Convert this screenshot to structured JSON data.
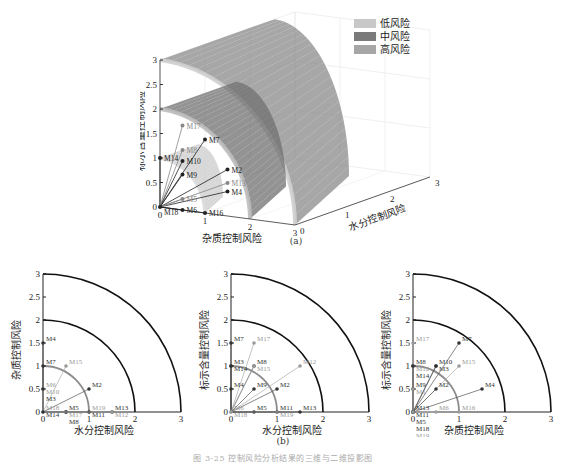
{
  "figure": {
    "caption_a": "(a)",
    "caption_b": "(b)",
    "title": "图 3-25  控制风险分析结果的三维与二维投影图"
  },
  "legend": {
    "items": [
      {
        "label": "低风险",
        "color": "#c8c8c8"
      },
      {
        "label": "中风险",
        "color": "#7a7a7a"
      },
      {
        "label": "高风险",
        "color": "#a6a6a6"
      }
    ]
  },
  "chart_data": [
    {
      "id": "a",
      "type": "scatter",
      "title": "(a)",
      "dimensions": 3,
      "axes": {
        "x": {
          "label": "杂质控制风险",
          "ticks": [
            0,
            1,
            2,
            3
          ],
          "range": [
            0,
            3
          ]
        },
        "y": {
          "label": "水分控制风险",
          "ticks": [
            0,
            1,
            2,
            3
          ],
          "range": [
            0,
            3
          ]
        },
        "z": {
          "label": "标示含量控制风险",
          "ticks": [
            0,
            0.5,
            1,
            1.5,
            2,
            2.5,
            3
          ],
          "range": [
            0,
            3
          ]
        }
      },
      "surfaces": [
        {
          "name": "低风险",
          "radius": 1
        },
        {
          "name": "中风险",
          "radius": 2
        },
        {
          "name": "高风险",
          "radius": 3
        }
      ],
      "legend_position": "upper right",
      "points": [
        {
          "label": "M2",
          "x": 0.5,
          "y": 1.0,
          "z": 0.5
        },
        {
          "label": "M4",
          "x": 1.5,
          "y": 0.0,
          "z": 0.5
        },
        {
          "label": "M5",
          "x": 0.0,
          "y": 0.5,
          "z": 0.0
        },
        {
          "label": "M6",
          "x": 0.5,
          "y": 0.0,
          "z": 0.0
        },
        {
          "label": "M7",
          "x": 1.0,
          "y": 0.0,
          "z": 1.5
        },
        {
          "label": "M8",
          "x": 0.0,
          "y": 0.5,
          "z": 1.0
        },
        {
          "label": "M9",
          "x": 0.0,
          "y": 0.5,
          "z": 0.5
        },
        {
          "label": "M10",
          "x": 0.5,
          "y": 0.0,
          "z": 1.0
        },
        {
          "label": "M13",
          "x": 0.0,
          "y": 1.5,
          "z": 0.0
        },
        {
          "label": "M14",
          "x": 0.0,
          "y": 0.0,
          "z": 1.0
        },
        {
          "label": "M16",
          "x": 1.0,
          "y": 0.0,
          "z": 0.0
        },
        {
          "label": "M17",
          "x": 0.0,
          "y": 0.5,
          "z": 1.5
        },
        {
          "label": "M18",
          "x": 0.0,
          "y": 0.0,
          "z": 0.0
        }
      ]
    },
    {
      "id": "b1",
      "type": "scatter",
      "title": "(b) 水分-杂质",
      "axes": {
        "x": {
          "label": "水分控制风险",
          "ticks": [
            0,
            1,
            2,
            3
          ],
          "range": [
            0,
            3
          ]
        },
        "y": {
          "label": "杂质控制风险",
          "ticks": [
            0,
            0.5,
            1,
            1.5,
            2,
            2.5,
            3
          ],
          "range": [
            0,
            3
          ]
        }
      },
      "arcs": [
        1,
        2,
        3
      ],
      "points": [
        {
          "label": "M4",
          "x": 0,
          "y": 1.5,
          "color": "#333"
        },
        {
          "label": "M7",
          "x": 0,
          "y": 1.0,
          "color": "#333"
        },
        {
          "label": "M15",
          "x": 0.5,
          "y": 1.0,
          "color": "#999"
        },
        {
          "label": "M6",
          "x": 0,
          "y": 0.5,
          "color": "#999"
        },
        {
          "label": "M10",
          "x": 0,
          "y": 0.5,
          "color": "#999"
        },
        {
          "label": "M3",
          "x": 0,
          "y": 0.5,
          "color": "#333"
        },
        {
          "label": "M2",
          "x": 1.0,
          "y": 0.5,
          "color": "#333"
        },
        {
          "label": "M5",
          "x": 0.5,
          "y": 0,
          "color": "#333"
        },
        {
          "label": "M17",
          "x": 0.5,
          "y": 0,
          "color": "#999"
        },
        {
          "label": "M8",
          "x": 0.5,
          "y": 0,
          "color": "#333"
        },
        {
          "label": "M19",
          "x": 1.0,
          "y": 0,
          "color": "#999"
        },
        {
          "label": "M11",
          "x": 1.0,
          "y": 0,
          "color": "#333"
        },
        {
          "label": "M13",
          "x": 1.5,
          "y": 0,
          "color": "#333"
        },
        {
          "label": "M12",
          "x": 1.5,
          "y": 0,
          "color": "#999"
        },
        {
          "label": "M18",
          "x": 0,
          "y": 0,
          "color": "#999"
        },
        {
          "label": "M14",
          "x": 0,
          "y": 0,
          "color": "#333"
        }
      ]
    },
    {
      "id": "b2",
      "type": "scatter",
      "title": "(b) 水分-标示含量",
      "axes": {
        "x": {
          "label": "水分控制风险",
          "ticks": [
            0,
            1,
            2,
            3
          ],
          "range": [
            0,
            3
          ]
        },
        "y": {
          "label": "标示含量控制风险",
          "ticks": [
            0,
            0.5,
            1,
            1.5,
            2,
            2.5,
            3
          ],
          "range": [
            0,
            3
          ]
        }
      },
      "arcs": [
        1,
        2,
        3
      ],
      "points": [
        {
          "label": "M7",
          "x": 0,
          "y": 1.5,
          "color": "#333"
        },
        {
          "label": "M17",
          "x": 0.5,
          "y": 1.5,
          "color": "#999"
        },
        {
          "label": "M3",
          "x": 0,
          "y": 1.0,
          "color": "#333"
        },
        {
          "label": "M14",
          "x": 0,
          "y": 1.0,
          "color": "#333"
        },
        {
          "label": "M8",
          "x": 0.5,
          "y": 1.0,
          "color": "#333"
        },
        {
          "label": "M15",
          "x": 0.5,
          "y": 1.0,
          "color": "#999"
        },
        {
          "label": "M12",
          "x": 1.5,
          "y": 1.0,
          "color": "#999"
        },
        {
          "label": "M4",
          "x": 0,
          "y": 0.5,
          "color": "#333"
        },
        {
          "label": "M9",
          "x": 0.5,
          "y": 0.5,
          "color": "#333"
        },
        {
          "label": "M2",
          "x": 1.0,
          "y": 0.5,
          "color": "#333"
        },
        {
          "label": "M5",
          "x": 0.5,
          "y": 0,
          "color": "#333"
        },
        {
          "label": "M11",
          "x": 1.0,
          "y": 0,
          "color": "#333"
        },
        {
          "label": "M19",
          "x": 1.0,
          "y": 0,
          "color": "#999"
        },
        {
          "label": "M13",
          "x": 1.5,
          "y": 0,
          "color": "#333"
        },
        {
          "label": "M6",
          "x": 0,
          "y": 0,
          "color": "#999"
        },
        {
          "label": "M18",
          "x": 0,
          "y": 0,
          "color": "#999"
        }
      ]
    },
    {
      "id": "b3",
      "type": "scatter",
      "title": "(b) 杂质-标示含量",
      "axes": {
        "x": {
          "label": "杂质控制风险",
          "ticks": [
            0,
            1,
            2,
            3
          ],
          "range": [
            0,
            3
          ]
        },
        "y": {
          "label": "标示含量控制风险",
          "ticks": [
            0,
            0.5,
            1,
            1.5,
            2,
            2.5,
            3
          ],
          "range": [
            0,
            3
          ]
        }
      },
      "arcs": [
        1,
        2,
        3
      ],
      "points": [
        {
          "label": "M17",
          "x": 0,
          "y": 1.5,
          "color": "#999"
        },
        {
          "label": "M7",
          "x": 1.0,
          "y": 1.5,
          "color": "#333"
        },
        {
          "label": "M8",
          "x": 0,
          "y": 1.0,
          "color": "#333"
        },
        {
          "label": "M12",
          "x": 0,
          "y": 1.0,
          "color": "#999"
        },
        {
          "label": "M14",
          "x": 0,
          "y": 1.0,
          "color": "#333"
        },
        {
          "label": "M10",
          "x": 0.5,
          "y": 1.0,
          "color": "#333"
        },
        {
          "label": "M3",
          "x": 0.5,
          "y": 1.0,
          "color": "#333"
        },
        {
          "label": "M15",
          "x": 1.0,
          "y": 1.0,
          "color": "#999"
        },
        {
          "label": "M9",
          "x": 0,
          "y": 0.5,
          "color": "#333"
        },
        {
          "label": "M1",
          "x": 0,
          "y": 0.5,
          "color": "#999"
        },
        {
          "label": "M2",
          "x": 0.5,
          "y": 0.5,
          "color": "#333"
        },
        {
          "label": "M4",
          "x": 1.5,
          "y": 0.5,
          "color": "#333"
        },
        {
          "label": "M6",
          "x": 0.5,
          "y": 0,
          "color": "#999"
        },
        {
          "label": "M16",
          "x": 1.0,
          "y": 0,
          "color": "#999"
        },
        {
          "label": "M13",
          "x": 0,
          "y": 0,
          "color": "#333"
        },
        {
          "label": "M11",
          "x": 0,
          "y": 0,
          "color": "#333"
        },
        {
          "label": "M5",
          "x": 0,
          "y": 0,
          "color": "#333"
        },
        {
          "label": "M18",
          "x": 0,
          "y": 0,
          "color": "#333"
        },
        {
          "label": "M19",
          "x": 0,
          "y": 0,
          "color": "#999"
        }
      ]
    }
  ]
}
